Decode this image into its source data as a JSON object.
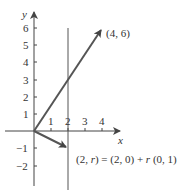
{
  "axes": {
    "x_label": "x",
    "y_label": "y",
    "x_ticks": [
      "1",
      "2",
      "3",
      "4"
    ],
    "y_ticks_pos": [
      "1",
      "2",
      "3",
      "4",
      "5",
      "6"
    ],
    "y_ticks_neg": [
      "−1",
      "−2"
    ]
  },
  "vectors": [
    {
      "name": "vector-to-4-6",
      "from": [
        0,
        0
      ],
      "to": [
        4,
        6
      ],
      "label": "(4, 6)"
    },
    {
      "name": "vector-to-2-r",
      "from": [
        0,
        0
      ],
      "to": [
        2,
        -1
      ],
      "label": "(2, r) = (2, 0) + r (0, 1)"
    }
  ],
  "line": {
    "name": "vertical-line-x-2",
    "x": 2
  },
  "colors": {
    "axis": "#444444",
    "vector": "#555555",
    "line": "#555555",
    "text": "#333333"
  }
}
